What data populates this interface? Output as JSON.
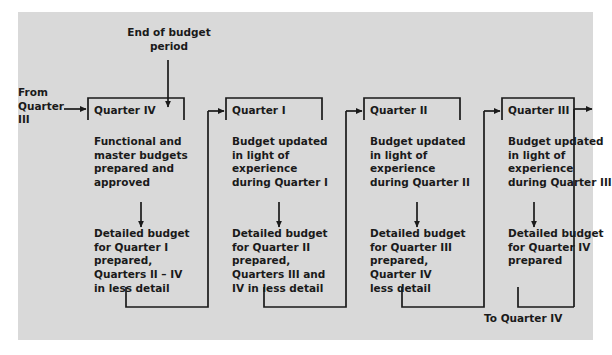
{
  "figure": {
    "background_color": "#d9d9d9",
    "line_color": "#1a1a1a",
    "text_color": "#1a1a1a"
  },
  "annotations": {
    "end_of_budget_period": "End of budget\nperiod",
    "from_quarter": "From\nQuarter\nIII",
    "to_quarter": "To Quarter IV"
  },
  "boxes": [
    {
      "title": "Quarter IV",
      "upper": "Functional and\nmaster budgets\nprepared and\napproved",
      "lower": "Detailed budget\nfor Quarter I\nprepared,\nQuarters II – IV\nin less detail"
    },
    {
      "title": "Quarter I",
      "upper": "Budget updated\nin light of\nexperience\nduring Quarter I",
      "lower": "Detailed budget\nfor Quarter II\nprepared,\nQuarters III and\nIV in less detail"
    },
    {
      "title": "Quarter II",
      "upper": "Budget updated\nin light of\nexperience\nduring Quarter II",
      "lower": "Detailed budget\nfor Quarter III\nprepared,\nQuarter IV\nless detail"
    },
    {
      "title": "Quarter III",
      "upper": "Budget updated\nin light of\nexperience\nduring Quarter III",
      "lower": "Detailed budget\nfor Quarter IV\nprepared"
    }
  ]
}
